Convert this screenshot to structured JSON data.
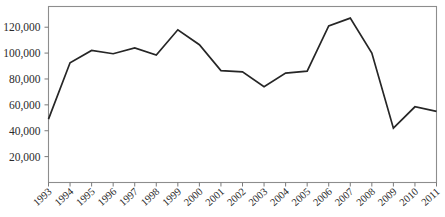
{
  "chart_data": {
    "type": "line",
    "title": "",
    "subtitle": "",
    "xlabel": "",
    "ylabel": "",
    "categories": [
      "1993",
      "1994",
      "1995",
      "1996",
      "1997",
      "1998",
      "1999",
      "2000",
      "2001",
      "2002",
      "2003",
      "2004",
      "2005",
      "2006",
      "2007",
      "2008",
      "2009",
      "2010",
      "2011"
    ],
    "values": [
      49000,
      92500,
      102000,
      99500,
      104000,
      98500,
      118000,
      106500,
      86500,
      85500,
      74000,
      84500,
      86000,
      121000,
      127000,
      100000,
      42000,
      58500,
      55000
    ],
    "series": [
      {
        "name": "",
        "values": [
          49000,
          92500,
          102000,
          99500,
          104000,
          98500,
          118000,
          106500,
          86500,
          85500,
          74000,
          84500,
          86000,
          121000,
          127000,
          100000,
          42000,
          58500,
          55000
        ]
      }
    ],
    "ylim": [
      0,
      136000
    ],
    "xlim": [
      "1993",
      "2011"
    ],
    "yticks": [
      20000,
      40000,
      60000,
      80000,
      100000,
      120000
    ],
    "ytick_labels": [
      "20,000",
      "40,000",
      "60,000",
      "80,000",
      "100,000",
      "120,000"
    ],
    "xtick_labels": [
      "1993",
      "1994",
      "1995",
      "1996",
      "1997",
      "1998",
      "1999",
      "2000",
      "2001",
      "2002",
      "2003",
      "2004",
      "2005",
      "2006",
      "2007",
      "2008",
      "2009",
      "2010",
      "2011"
    ],
    "grid": false,
    "legend": false,
    "legend_position": "none",
    "annotations": [],
    "colors": {
      "line": "#262626",
      "frame": "#8d8d8d",
      "tick": "#7a7a7a",
      "text": "#2b2b2b",
      "background": "#ffffff"
    }
  }
}
